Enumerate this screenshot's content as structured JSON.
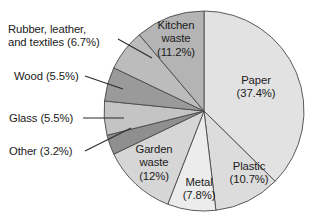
{
  "chart_data": {
    "type": "pie",
    "title": "",
    "subtitle": "",
    "xlabel": "",
    "ylabel": "",
    "legend_position": "none",
    "grid": false,
    "units": "percent",
    "start_angle_deg": 0,
    "direction": "clockwise",
    "categories": [
      "Paper",
      "Plastic",
      "Metal",
      "Garden waste",
      "Other",
      "Glass",
      "Wood",
      "Rubber, leather, and textiles",
      "Kitchen waste"
    ],
    "values": [
      37.4,
      10.7,
      7.8,
      12,
      3.2,
      5.5,
      5.5,
      6.7,
      11.2
    ],
    "slices": [
      {
        "name": "Paper",
        "value": 37.4,
        "label": "Paper",
        "value_label": "(37.4%)",
        "color": "#e2e2e2",
        "label_placement": "inside"
      },
      {
        "name": "Plastic",
        "value": 10.7,
        "label": "Plastic",
        "value_label": "(10.7%)",
        "color": "#dcdcdc",
        "label_placement": "inside"
      },
      {
        "name": "Metal",
        "value": 7.8,
        "label": "Metal",
        "value_label": "(7.8%)",
        "color": "#ececec",
        "label_placement": "inside"
      },
      {
        "name": "Garden waste",
        "value": 12,
        "label": "Garden\nwaste",
        "value_label": "(12%)",
        "color": "#d6d6d6",
        "label_placement": "inside"
      },
      {
        "name": "Other",
        "value": 3.2,
        "label": "Other",
        "value_label": "(3.2%)",
        "color": "#8f8f8f",
        "label_placement": "outside-left"
      },
      {
        "name": "Glass",
        "value": 5.5,
        "label": "Glass",
        "value_label": "(5.5%)",
        "color": "#c4c4c4",
        "label_placement": "outside-left"
      },
      {
        "name": "Wood",
        "value": 5.5,
        "label": "Wood",
        "value_label": "(5.5%)",
        "color": "#9a9a9a",
        "label_placement": "outside-left"
      },
      {
        "name": "Rubber, leather, and textiles",
        "value": 6.7,
        "label": "Rubber, leather,\nand textiles",
        "value_label": "(6.7%)",
        "color": "#bcbcbc",
        "label_placement": "outside-left"
      },
      {
        "name": "Kitchen waste",
        "value": 11.2,
        "label": "Kitchen\nwaste",
        "value_label": "(11.2%)",
        "color": "#b4b4b4",
        "label_placement": "inside"
      }
    ]
  },
  "labels": {
    "rubber": "Rubber, leather,\nand textiles (6.7%)",
    "wood": "Wood (5.5%)",
    "glass": "Glass (5.5%)",
    "other": "Other (3.2%)",
    "kitchen": "Kitchen\nwaste\n(11.2%)",
    "paper": "Paper\n(37.4%)",
    "plastic": "Plastic\n(10.7%)",
    "metal": "Metal\n(7.8%)",
    "garden": "Garden\nwaste\n(12%)"
  },
  "style": {
    "background": "#ffffff",
    "slice_outline": "#4a4a4a",
    "text_color": "#1b1b1b",
    "leader_color": "#2b2b2b"
  },
  "geometry": {
    "center_x": 204,
    "center_y": 111,
    "radius": 100
  }
}
